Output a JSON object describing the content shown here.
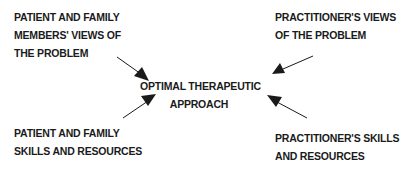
{
  "diagram": {
    "center": {
      "lines": [
        "OPTIMAL THERAPEUTIC",
        "APPROACH"
      ]
    },
    "inputs": [
      {
        "position": "top-left",
        "lines": [
          "PATIENT AND FAMILY",
          "MEMBERS' VIEWS OF",
          "THE PROBLEM"
        ]
      },
      {
        "position": "top-right",
        "lines": [
          "PRACTITIONER'S VIEWS",
          "OF THE PROBLEM"
        ]
      },
      {
        "position": "bottom-left",
        "lines": [
          "PATIENT AND FAMILY",
          "SKILLS AND RESOURCES"
        ]
      },
      {
        "position": "bottom-right",
        "lines": [
          "PRACTITIONER'S SKILLS",
          "AND RESOURCES"
        ]
      }
    ],
    "arrow_color": "#1a1a1a",
    "text_color": "#1a1a1a"
  }
}
